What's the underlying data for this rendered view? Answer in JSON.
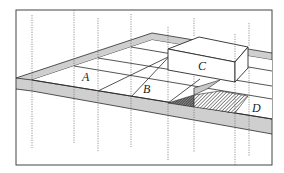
{
  "diagram": {
    "type": "isometric-grid-floor",
    "colors": {
      "line": "#2a2a2a",
      "border_fill": "#cfcfcf",
      "shadow_fill": "#bdbdbd",
      "dashed_line": "#6a6a6a",
      "background": "#ffffff"
    },
    "labels": {
      "a": "A",
      "b": "B",
      "c": "C",
      "d": "D"
    },
    "elements": [
      {
        "id": "A",
        "kind": "floor-cell"
      },
      {
        "id": "B",
        "kind": "floor-cell"
      },
      {
        "id": "C",
        "kind": "raised-box"
      },
      {
        "id": "D",
        "kind": "floor-cell"
      }
    ]
  }
}
